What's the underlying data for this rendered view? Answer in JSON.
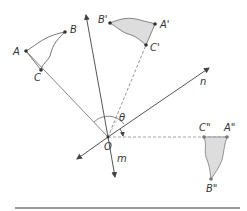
{
  "diagram": {
    "type": "geometric-transformation",
    "colors": {
      "line": "#555555",
      "dashed": "#888888",
      "shade": "#dddddd",
      "point": "#333333",
      "rule": "#999999"
    },
    "points": {
      "O": {
        "label": "O",
        "x": 108,
        "y": 137
      },
      "A": {
        "label": "A",
        "x": 26,
        "y": 51
      },
      "B": {
        "label": "B",
        "x": 65,
        "y": 32
      },
      "C": {
        "label": "C",
        "x": 41,
        "y": 70
      },
      "A1": {
        "label": "A'",
        "x": 155,
        "y": 24
      },
      "B1": {
        "label": "B'",
        "x": 110,
        "y": 23
      },
      "C1": {
        "label": "C'",
        "x": 146,
        "y": 45
      },
      "A2": {
        "label": "A\"",
        "x": 227,
        "y": 137
      },
      "B2": {
        "label": "B\"",
        "x": 211,
        "y": 179
      },
      "C2": {
        "label": "C\"",
        "x": 204,
        "y": 137
      }
    },
    "lines": {
      "n": {
        "label": "n"
      },
      "m": {
        "label": "m"
      }
    },
    "angle": {
      "label": "θ"
    }
  }
}
